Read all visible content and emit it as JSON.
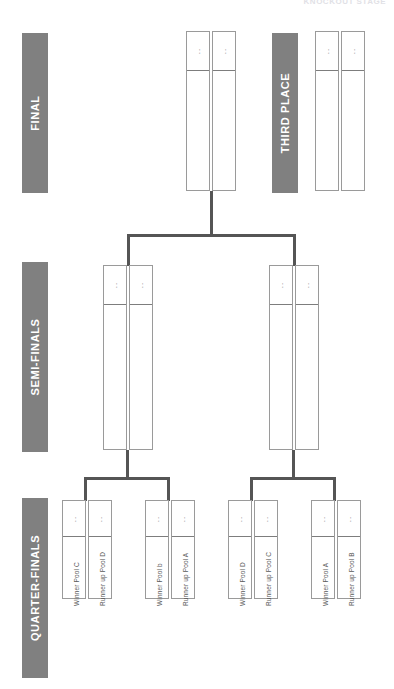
{
  "page": {
    "top_caption": "KNOCKOUT STAGE",
    "score_placeholder": ".."
  },
  "colors": {
    "label_block": "#808080",
    "label_text": "#ffffff",
    "box_border": "#9a9a9a",
    "connector": "#555555",
    "caption_text": "#5a5a5a",
    "background": "#ffffff"
  },
  "rounds": [
    {
      "key": "final",
      "label": "FINAL"
    },
    {
      "key": "third_place",
      "label": "THIRD PLACE"
    },
    {
      "key": "semi_finals",
      "label": "SEMI-FINALS"
    },
    {
      "key": "quarter_finals",
      "label": "QUARTER-FINALS"
    }
  ],
  "final": {
    "label": "FINAL",
    "slots": [
      {
        "score": ".."
      },
      {
        "score": ".."
      }
    ]
  },
  "third_place": {
    "label": "THIRD PLACE",
    "slots": [
      {
        "score": ".."
      },
      {
        "score": ".."
      }
    ]
  },
  "semi_finals": {
    "label": "SEMI-FINALS",
    "matches": [
      {
        "slots": [
          {
            "score": ".."
          },
          {
            "score": ".."
          }
        ]
      },
      {
        "slots": [
          {
            "score": ".."
          },
          {
            "score": ".."
          }
        ]
      }
    ]
  },
  "quarter_finals": {
    "label": "QUARTER-FINALS",
    "matches": [
      {
        "slots": [
          {
            "score": "..",
            "entrant": "Winner Pool C"
          },
          {
            "score": "..",
            "entrant": "Runner up Pool D"
          }
        ]
      },
      {
        "slots": [
          {
            "score": "..",
            "entrant": "Winner Pool b"
          },
          {
            "score": "..",
            "entrant": "Runner up Pool A"
          }
        ]
      },
      {
        "slots": [
          {
            "score": "..",
            "entrant": "Winner Pool D"
          },
          {
            "score": "..",
            "entrant": "Runner up Pool C"
          }
        ]
      },
      {
        "slots": [
          {
            "score": "..",
            "entrant": "Winner Pool A"
          },
          {
            "score": "..",
            "entrant": "Runner up Pool B"
          }
        ]
      }
    ]
  }
}
